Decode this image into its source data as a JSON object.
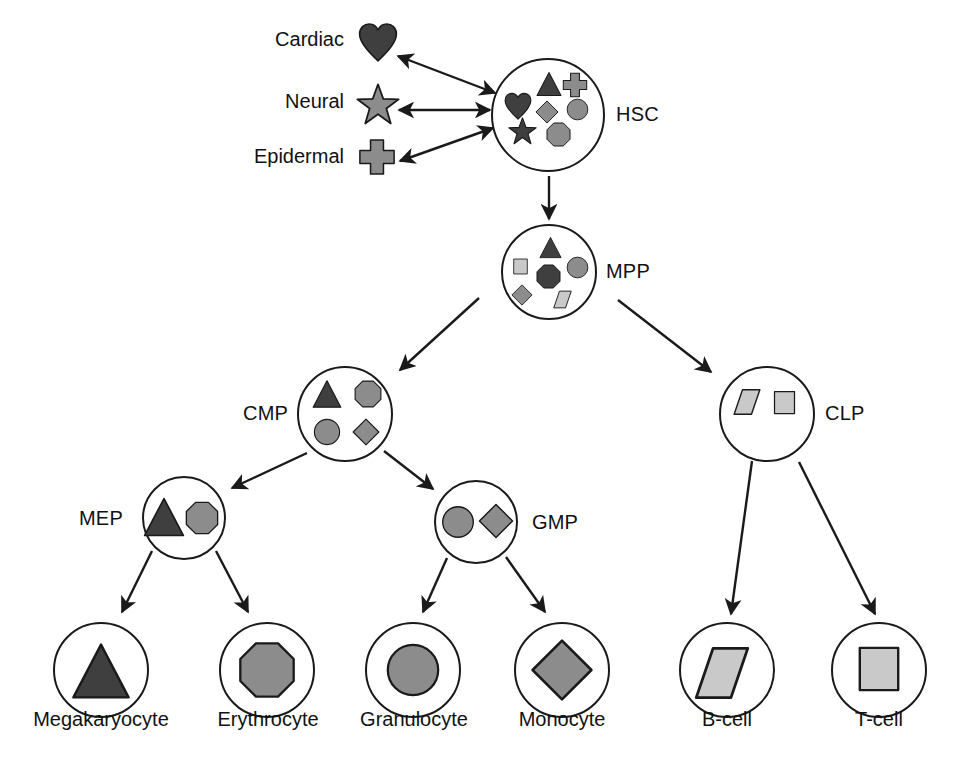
{
  "figure": {
    "palette": {
      "dark": "#3f3f3f",
      "mid": "#8c8c8c",
      "light": "#c9c9c9",
      "outline": "#1a1a1a",
      "background": "#ffffff"
    }
  },
  "lineages": [
    {
      "label": "Cardiac",
      "icon": "heart-shape",
      "tone": "dark",
      "x": 268,
      "y": 28,
      "w": 76,
      "h": 22,
      "sx": 358,
      "sy": 22,
      "ss": 40
    },
    {
      "label": "Neural",
      "icon": "star-shape",
      "tone": "mid",
      "x": 268,
      "y": 90,
      "w": 76,
      "h": 22,
      "sx": 356,
      "sy": 83,
      "ss": 44
    },
    {
      "label": "Epidermal",
      "icon": "cross-shape",
      "tone": "mid",
      "x": 240,
      "y": 145,
      "w": 104,
      "h": 22,
      "sx": 358,
      "sy": 138,
      "ss": 38
    }
  ],
  "nodes": [
    {
      "id": "hsc",
      "label": "HSC",
      "cx": 548,
      "cy": 115,
      "r": 57,
      "label_x": 616,
      "label_y": 103,
      "label_size": 20,
      "contents": [
        {
          "icon": "triangle-shape",
          "tone": "dark",
          "x": 536,
          "y": 71,
          "s": 26
        },
        {
          "icon": "cross-shape",
          "tone": "mid",
          "x": 562,
          "y": 72,
          "s": 26
        },
        {
          "icon": "heart-shape",
          "tone": "dark",
          "x": 504,
          "y": 92,
          "s": 28
        },
        {
          "icon": "diamond-shape",
          "tone": "mid",
          "x": 535,
          "y": 100,
          "s": 24
        },
        {
          "icon": "circle-shape",
          "tone": "mid",
          "x": 566,
          "y": 98,
          "s": 23
        },
        {
          "icon": "star-shape",
          "tone": "dark",
          "x": 508,
          "y": 117,
          "s": 29
        },
        {
          "icon": "octagon-shape",
          "tone": "mid",
          "x": 546,
          "y": 122,
          "s": 25
        }
      ]
    },
    {
      "id": "mpp",
      "label": "MPP",
      "cx": 549,
      "cy": 272,
      "r": 48,
      "label_x": 606,
      "label_y": 260,
      "label_size": 20,
      "contents": [
        {
          "icon": "triangle-shape",
          "tone": "dark",
          "x": 539,
          "y": 236,
          "s": 23
        },
        {
          "icon": "square-shape",
          "tone": "light",
          "x": 512,
          "y": 258,
          "s": 17
        },
        {
          "icon": "circle-shape",
          "tone": "mid",
          "x": 566,
          "y": 256,
          "s": 23
        },
        {
          "icon": "octagon-shape",
          "tone": "dark",
          "x": 536,
          "y": 264,
          "s": 25
        },
        {
          "icon": "diamond-shape",
          "tone": "mid",
          "x": 511,
          "y": 284,
          "s": 22
        },
        {
          "icon": "parallelogram-shape",
          "tone": "light",
          "x": 553,
          "y": 290,
          "s": 19
        }
      ]
    },
    {
      "id": "cmp",
      "label": "CMP",
      "cx": 345,
      "cy": 414,
      "r": 48,
      "label_x": 243,
      "label_y": 402,
      "label_size": 20,
      "contents": [
        {
          "icon": "triangle-shape",
          "tone": "dark",
          "x": 312,
          "y": 379,
          "s": 30
        },
        {
          "icon": "octagon-shape",
          "tone": "mid",
          "x": 354,
          "y": 380,
          "s": 28
        },
        {
          "icon": "circle-shape",
          "tone": "mid",
          "x": 313,
          "y": 418,
          "s": 28
        },
        {
          "icon": "diamond-shape",
          "tone": "mid",
          "x": 352,
          "y": 418,
          "s": 28
        }
      ]
    },
    {
      "id": "clp",
      "label": "CLP",
      "cx": 767,
      "cy": 414,
      "r": 48,
      "label_x": 825,
      "label_y": 402,
      "label_size": 20,
      "contents": [
        {
          "icon": "parallelogram-shape",
          "tone": "light",
          "x": 733,
          "y": 388,
          "s": 28
        },
        {
          "icon": "square-shape",
          "tone": "light",
          "x": 772,
          "y": 390,
          "s": 25
        }
      ]
    },
    {
      "id": "mep",
      "label": "MEP",
      "cx": 184,
      "cy": 518,
      "r": 42,
      "label_x": 79,
      "label_y": 507,
      "label_size": 20,
      "contents": [
        {
          "icon": "triangle-shape",
          "tone": "dark",
          "x": 143,
          "y": 496,
          "s": 42
        },
        {
          "icon": "octagon-shape",
          "tone": "mid",
          "x": 185,
          "y": 501,
          "s": 34
        }
      ]
    },
    {
      "id": "gmp",
      "label": "GMP",
      "cx": 476,
      "cy": 522,
      "r": 42,
      "label_x": 532,
      "label_y": 511,
      "label_size": 20,
      "contents": [
        {
          "icon": "circle-shape",
          "tone": "mid",
          "x": 441,
          "y": 505,
          "s": 34
        },
        {
          "icon": "diamond-shape",
          "tone": "mid",
          "x": 478,
          "y": 503,
          "s": 36
        }
      ]
    }
  ],
  "terminals": [
    {
      "label": "Megakaryocyte",
      "cx": 101,
      "cy": 670,
      "r": 48,
      "icon": "triangle-shape",
      "tone": "dark",
      "sx": 71,
      "sy": 641,
      "ss": 60,
      "lx": 10,
      "ly": 708,
      "lw": 182
    },
    {
      "label": "Erythrocyte",
      "cx": 267,
      "cy": 670,
      "r": 48,
      "icon": "octagon-shape",
      "tone": "mid",
      "sx": 238,
      "sy": 641,
      "ss": 58,
      "lx": 180,
      "ly": 708,
      "lw": 176
    },
    {
      "label": "Granulocyte",
      "cx": 413,
      "cy": 670,
      "r": 48,
      "icon": "circle-shape",
      "tone": "mid",
      "sx": 385,
      "sy": 642,
      "ss": 56,
      "lx": 326,
      "ly": 708,
      "lw": 176
    },
    {
      "label": "Monocyte",
      "cx": 562,
      "cy": 670,
      "r": 48,
      "icon": "diamond-shape",
      "tone": "mid",
      "sx": 530,
      "sy": 638,
      "ss": 64,
      "lx": 486,
      "ly": 708,
      "lw": 152
    },
    {
      "label": "B-cell",
      "cx": 727,
      "cy": 670,
      "r": 48,
      "icon": "parallelogram-shape",
      "tone": "light",
      "sx": 694,
      "sy": 645,
      "ss": 56,
      "lx": 671,
      "ly": 708,
      "lw": 112
    },
    {
      "label": "T-cell",
      "cx": 879,
      "cy": 670,
      "r": 48,
      "icon": "square-shape",
      "tone": "light",
      "sx": 855,
      "sy": 645,
      "ss": 48,
      "lx": 823,
      "ly": 708,
      "lw": 112
    }
  ],
  "edges": [
    {
      "name": "hsc-cardiac",
      "kind": "double",
      "x1": 495,
      "y1": 93,
      "x2": 398,
      "y2": 56
    },
    {
      "name": "hsc-neural",
      "kind": "double",
      "x1": 490,
      "y1": 110,
      "x2": 399,
      "y2": 110
    },
    {
      "name": "hsc-epidermal",
      "kind": "double",
      "x1": 493,
      "y1": 128,
      "x2": 400,
      "y2": 161
    },
    {
      "name": "hsc-mpp",
      "kind": "single",
      "x1": 549,
      "y1": 176,
      "x2": 549,
      "y2": 219
    },
    {
      "name": "mpp-cmp",
      "kind": "single",
      "x1": 479,
      "y1": 298,
      "x2": 400,
      "y2": 370
    },
    {
      "name": "mpp-clp",
      "kind": "single",
      "x1": 618,
      "y1": 300,
      "x2": 711,
      "y2": 372
    },
    {
      "name": "cmp-mep",
      "kind": "single",
      "x1": 307,
      "y1": 453,
      "x2": 232,
      "y2": 488
    },
    {
      "name": "cmp-gmp",
      "kind": "single",
      "x1": 384,
      "y1": 451,
      "x2": 433,
      "y2": 489
    },
    {
      "name": "mep-megakaryocyte",
      "kind": "single",
      "x1": 152,
      "y1": 551,
      "x2": 122,
      "y2": 612
    },
    {
      "name": "mep-erythrocyte",
      "kind": "single",
      "x1": 216,
      "y1": 551,
      "x2": 248,
      "y2": 612
    },
    {
      "name": "gmp-granulocyte",
      "kind": "single",
      "x1": 447,
      "y1": 558,
      "x2": 423,
      "y2": 612
    },
    {
      "name": "gmp-monocyte",
      "kind": "single",
      "x1": 506,
      "y1": 557,
      "x2": 545,
      "y2": 612
    },
    {
      "name": "clp-bcell",
      "kind": "single",
      "x1": 752,
      "y1": 461,
      "x2": 731,
      "y2": 614
    },
    {
      "name": "clp-tcell",
      "kind": "single",
      "x1": 799,
      "y1": 462,
      "x2": 875,
      "y2": 614
    }
  ]
}
